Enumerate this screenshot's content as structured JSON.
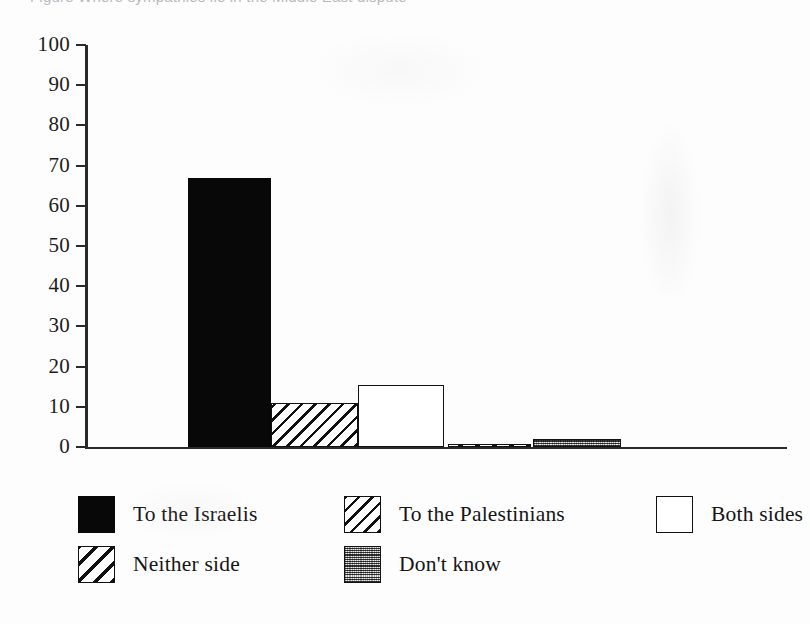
{
  "figure": {
    "title_sliver": "Figure  Where sympathies lie in the Middle East dispute",
    "background": "#fdfdfd",
    "ink": "#111111"
  },
  "chart_data": {
    "type": "bar",
    "title": "",
    "subtitle": "",
    "xlabel": "",
    "ylabel": "",
    "ylim": [
      0,
      100
    ],
    "ytick_step": 10,
    "ytick_labels": [
      "100",
      "90",
      "80",
      "70",
      "60",
      "50",
      "40",
      "30",
      "20",
      "10",
      "0"
    ],
    "ytick_values": [
      100,
      90,
      80,
      70,
      60,
      50,
      40,
      30,
      20,
      10,
      0
    ],
    "grid": false,
    "legend_position": "bottom",
    "categories": [
      "To the Israelis",
      "To the Palestinians",
      "Both sides",
      "Neither side",
      "Don't know"
    ],
    "values": [
      67,
      11,
      15.5,
      0.5,
      2
    ],
    "series": [
      {
        "name": "Percentage of respondents",
        "values": [
          67,
          11,
          15.5,
          0.5,
          2
        ]
      }
    ],
    "bar_fills": [
      "solid-black",
      "diagonal-hatch",
      "open-white",
      "coarse-diagonal-hatch",
      "gray-stipple"
    ],
    "annotations": []
  },
  "legend": {
    "rows": [
      [
        {
          "label": "To the Israelis",
          "fill": "solid-black",
          "left": 0
        },
        {
          "label": "To the Palestinians",
          "fill": "diagonal-hatch",
          "left": 266
        },
        {
          "label": "Both sides",
          "fill": "open-white",
          "left": 578
        }
      ],
      [
        {
          "label": "Neither side",
          "fill": "coarse-diagonal-hatch",
          "left": 0
        },
        {
          "label": "Don't know",
          "fill": "gray-stipple",
          "left": 266
        }
      ]
    ]
  }
}
